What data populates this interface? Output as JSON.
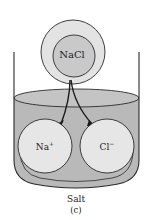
{
  "figure": {
    "compound_label": "NaCl",
    "ion_left": {
      "symbol": "Na",
      "charge": "+"
    },
    "ion_right": {
      "symbol": "Cl",
      "charge": "−"
    },
    "caption": "Salt",
    "panel_label": "(c)"
  },
  "colors": {
    "liquid": "#b9b9b9",
    "liquid_surface": "#c4c4c4",
    "ion_fill": "#e6e6e6",
    "molecule_back": "#e3e3e3",
    "molecule_front": "#c9c9c9",
    "stroke": "#2a2a2a"
  }
}
